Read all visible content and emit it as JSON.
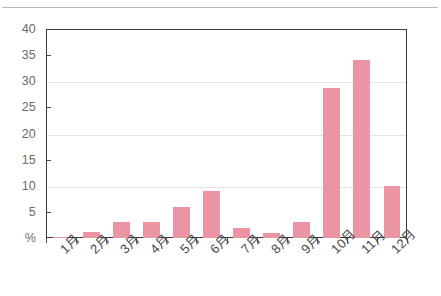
{
  "chart_data": {
    "type": "bar",
    "title": "",
    "xlabel": "",
    "ylabel": "%",
    "ylim": [
      0,
      40
    ],
    "ytick_labels": [
      "40",
      "35",
      "30",
      "25",
      "20",
      "15",
      "10",
      "5",
      "%"
    ],
    "yticks": [
      40,
      35,
      30,
      25,
      20,
      15,
      10,
      5,
      0
    ],
    "gridlines": [
      30,
      20,
      10
    ],
    "grid": true,
    "legend": "none",
    "bar_color": "#eb94a4",
    "categories": [
      "1月",
      "2月",
      "3月",
      "4月",
      "5月",
      "6月",
      "7月",
      "8月",
      "9月",
      "10月",
      "11月",
      "12月"
    ],
    "values": [
      0.2,
      1.1,
      3.0,
      3.1,
      6.0,
      9.0,
      2.0,
      1.0,
      3.0,
      28.7,
      34.0,
      10.0
    ]
  },
  "axis": {
    "unit_label": "%"
  }
}
